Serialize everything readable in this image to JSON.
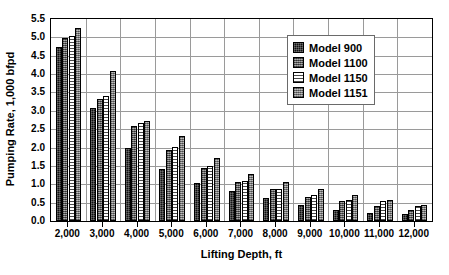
{
  "chart_data": {
    "type": "bar",
    "title": "",
    "xlabel": "Lifting Depth, ft",
    "ylabel": "Pumping Rate, 1,000 bfpd",
    "categories": [
      "2,000",
      "3,000",
      "4,000",
      "5,000",
      "6,000",
      "7,000",
      "8,000",
      "9,000",
      "10,000",
      "11,000",
      "12,000"
    ],
    "ylim": [
      0.0,
      5.5
    ],
    "ytick_labels": [
      "0.0",
      "0.5",
      "1.0",
      "1.5",
      "2.0",
      "2.5",
      "3.0",
      "3.5",
      "4.0",
      "4.5",
      "5.0",
      "5.5"
    ],
    "ytick_values": [
      0.0,
      0.5,
      1.0,
      1.5,
      2.0,
      2.5,
      3.0,
      3.5,
      4.0,
      4.5,
      5.0,
      5.5
    ],
    "grid": "horizontal-and-vertical",
    "legend_position": "top-right-inside",
    "series": [
      {
        "name": "Model 900",
        "swatch": "black-solid",
        "values": [
          4.75,
          3.07,
          1.98,
          1.42,
          1.03,
          0.82,
          0.64,
          0.43,
          0.31,
          0.22,
          0.19
        ]
      },
      {
        "name": "Model 1100",
        "swatch": "dark-gray-dotted",
        "values": [
          4.97,
          3.32,
          2.58,
          1.92,
          1.45,
          1.05,
          0.88,
          0.66,
          0.54,
          0.42,
          0.31
        ]
      },
      {
        "name": "Model 1150",
        "swatch": "white-horizontal-lines",
        "values": [
          5.03,
          3.4,
          2.67,
          2.02,
          1.51,
          1.1,
          0.87,
          0.71,
          0.58,
          0.54,
          0.42
        ]
      },
      {
        "name": "Model 1151",
        "swatch": "medium-gray-checker",
        "values": [
          5.25,
          4.08,
          2.72,
          2.31,
          1.72,
          1.28,
          1.06,
          0.86,
          0.7,
          0.56,
          0.43
        ]
      }
    ]
  },
  "axes": {
    "y_title": "Pumping Rate, 1,000 bfpd",
    "x_title": "Lifting Depth, ft"
  },
  "legend": {
    "entries": [
      {
        "label": "Model 900"
      },
      {
        "label": "Model 1100"
      },
      {
        "label": "Model 1150"
      },
      {
        "label": "Model 1151"
      }
    ]
  }
}
